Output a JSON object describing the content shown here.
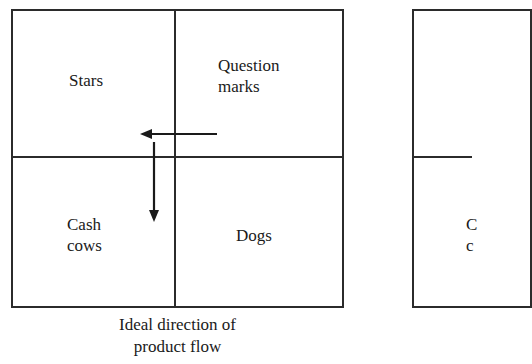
{
  "left_matrix": {
    "quadrants": {
      "top_left": "Stars",
      "top_right": "Question marks",
      "top_right_line1": "Question",
      "top_right_line2": "marks",
      "bottom_left": "Cash cows",
      "bottom_left_line1": "Cash",
      "bottom_left_line2": "cows",
      "bottom_right": "Dogs"
    },
    "arrows": [
      {
        "from": "Question marks",
        "to": "Stars",
        "direction": "left"
      },
      {
        "from": "Stars",
        "to": "Cash cows",
        "direction": "down"
      }
    ],
    "caption_line1": "Ideal direction of",
    "caption_line2": "product flow"
  },
  "right_matrix": {
    "partial_label_line1": "C",
    "partial_label_line2": "c"
  },
  "colors": {
    "line": "#2b2b2b",
    "text": "#1a1a1a",
    "background": "#ffffff"
  }
}
